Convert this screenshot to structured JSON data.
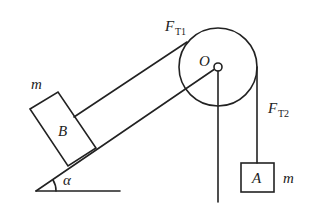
{
  "diagram": {
    "type": "physics-pulley-incline",
    "labels": {
      "tension1_main": "F",
      "tension1_sub": "T1",
      "tension2_main": "F",
      "tension2_sub": "T2",
      "pulley_center": "O",
      "block_on_incline": "B",
      "hanging_block": "A",
      "mass_b": "m",
      "mass_a": "m",
      "angle": "α"
    },
    "colors": {
      "stroke": "#222222",
      "background": "#ffffff"
    }
  }
}
